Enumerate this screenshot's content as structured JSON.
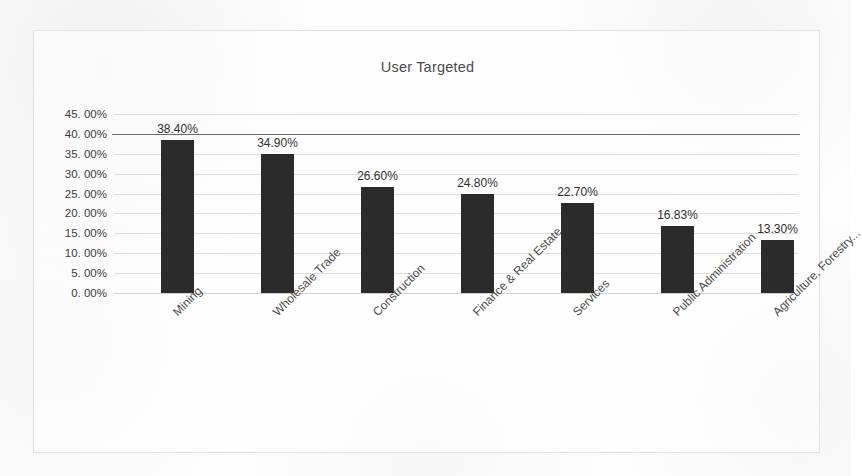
{
  "chart_data": {
    "type": "bar",
    "title": "User Targeted",
    "xlabel": "",
    "ylabel": "",
    "categories": [
      "Mining",
      "Wholesale Trade",
      "Construction",
      "Finance & Real Estate",
      "Services",
      "Public Administration",
      "Agriculture, Forestry..."
    ],
    "values": [
      38.4,
      34.9,
      26.6,
      24.8,
      22.7,
      16.83,
      13.3
    ],
    "data_labels": [
      "38.40%",
      "34.90%",
      "26.60%",
      "24.80%",
      "22.70%",
      "16.83%",
      "13.30%"
    ],
    "ylim": [
      0,
      45
    ],
    "ytick_labels": [
      "45. 00%",
      "40. 00%",
      "35. 00%",
      "30. 00%",
      "25. 00%",
      "20. 00%",
      "15. 00%",
      "10. 00%",
      "5. 00%",
      "0. 00%"
    ],
    "ytick_values": [
      45,
      40,
      35,
      30,
      25,
      20,
      15,
      10,
      5,
      0
    ],
    "grid": true,
    "legend": false,
    "bar_color": "#2b2b2b",
    "gridline_color": "#dedede",
    "title_color": "#4a4a4a"
  }
}
